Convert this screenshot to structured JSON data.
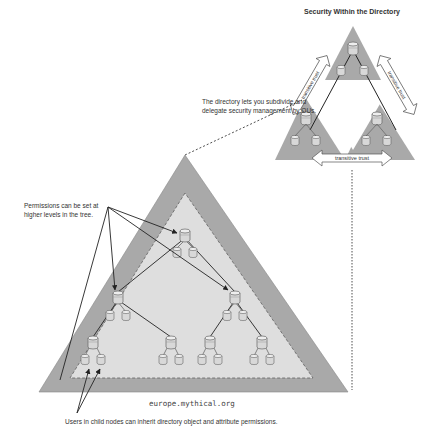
{
  "title": "Security Within the Directory",
  "callouts": {
    "subdivide_line1": "The directory lets you subdivide and",
    "subdivide_line2": "delegate security management by OUs.",
    "permissions_line1": "Permissions can be set at",
    "permissions_line2": "higher levels in the tree.",
    "inherit": "Users in child nodes can inherit directory object and attribute permissions."
  },
  "domain_label": "europe.mythical.org",
  "trust_labels": {
    "left": "transitive trust",
    "right": "transitive trust",
    "bottom": "transitive trust"
  },
  "colors": {
    "outer_triangle": "#a9a9a9",
    "inner_triangle": "#dedede",
    "node_fill": "#d8d8d8",
    "line": "#222222"
  },
  "icons": {
    "server": "database-cylinder-icon",
    "trust": "double-arrow-icon"
  }
}
